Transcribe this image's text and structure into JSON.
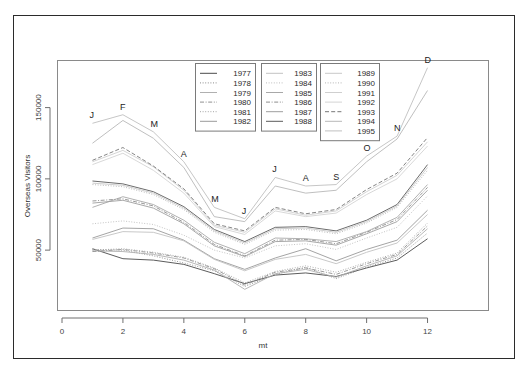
{
  "figure": {
    "frame_color": "#2b2b2b",
    "background": "#ffffff",
    "panel_border_color": "#8a8a8a"
  },
  "chart_data": {
    "type": "line",
    "title": "",
    "subtitle": "",
    "xlabel": "mt",
    "ylabel": "Overseas Visitors",
    "x": [
      1,
      2,
      3,
      4,
      5,
      6,
      7,
      8,
      9,
      10,
      11,
      12
    ],
    "xlim": [
      0,
      13
    ],
    "ylim": [
      8000,
      182000
    ],
    "xticks": [
      0,
      2,
      4,
      6,
      8,
      10,
      12
    ],
    "xticklabels": [
      "0",
      "2",
      "4",
      "6",
      "8",
      "10",
      "12"
    ],
    "yticks": [
      50000,
      100000,
      150000
    ],
    "yticklabels": [
      "50000",
      "100000",
      "150000"
    ],
    "grid": false,
    "legend_position": "top-center",
    "point_labels": [
      {
        "label": "J",
        "x": 1,
        "y": 139000
      },
      {
        "label": "F",
        "x": 2,
        "y": 145000
      },
      {
        "label": "M",
        "x": 3,
        "y": 133000
      },
      {
        "label": "A",
        "x": 4,
        "y": 112000
      },
      {
        "label": "M",
        "x": 5,
        "y": 80000
      },
      {
        "label": "J",
        "x": 6,
        "y": 72000
      },
      {
        "label": "J",
        "x": 7,
        "y": 101000
      },
      {
        "label": "A",
        "x": 8,
        "y": 95000
      },
      {
        "label": "S",
        "x": 9,
        "y": 96000
      },
      {
        "label": "O",
        "x": 10,
        "y": 116000
      },
      {
        "label": "N",
        "x": 11,
        "y": 130000
      },
      {
        "label": "D",
        "x": 12,
        "y": 178000
      }
    ],
    "series": [
      {
        "name": "1977",
        "dash": "solid",
        "color": "#4a4a4a",
        "values": [
          51000,
          44000,
          43000,
          40000,
          33500,
          26500,
          32500,
          34000,
          31500,
          37500,
          43000,
          58000
        ]
      },
      {
        "name": "1978",
        "dash": "dotted",
        "color": "#8c8c8c",
        "values": [
          50500,
          50000,
          46000,
          41000,
          35500,
          24500,
          33000,
          38000,
          30000,
          38000,
          44500,
          62000
        ]
      },
      {
        "name": "1979",
        "dash": "solid",
        "color": "#b0b0b0",
        "values": [
          49500,
          49000,
          47000,
          43000,
          36000,
          22500,
          33500,
          36500,
          31000,
          39000,
          46000,
          65000
        ]
      },
      {
        "name": "1980",
        "dash": "dashdot",
        "color": "#909090",
        "values": [
          49000,
          50500,
          48000,
          44500,
          37000,
          25500,
          34500,
          37500,
          33000,
          40500,
          47000,
          67000
        ]
      },
      {
        "name": "1981",
        "dash": "dotted",
        "color": "#a5a5a5",
        "values": [
          50000,
          51000,
          48500,
          45000,
          37500,
          27000,
          35000,
          39000,
          34500,
          41500,
          48000,
          69000
        ]
      },
      {
        "name": "1982",
        "dash": "solid",
        "color": "#9a9a9a",
        "values": [
          58500,
          65500,
          65000,
          57000,
          44000,
          36500,
          44500,
          51000,
          42500,
          50500,
          57000,
          78000
        ]
      },
      {
        "name": "1983",
        "dash": "solid",
        "color": "#c2c2c2",
        "values": [
          57500,
          63000,
          62500,
          56500,
          43500,
          35500,
          43500,
          47000,
          40500,
          48500,
          55000,
          75000
        ]
      },
      {
        "name": "1984",
        "dash": "dotted",
        "color": "#bdbdbd",
        "values": [
          68500,
          70500,
          68000,
          60500,
          50000,
          44500,
          53000,
          54500,
          50500,
          58500,
          66000,
          88000
        ]
      },
      {
        "name": "1985",
        "dash": "solid",
        "color": "#a8a8a8",
        "values": [
          80000,
          87500,
          82000,
          71000,
          55500,
          47500,
          58500,
          58000,
          56000,
          63000,
          73000,
          96000
        ]
      },
      {
        "name": "1986",
        "dash": "dashdot",
        "color": "#8d8d8d",
        "values": [
          84500,
          86000,
          81000,
          69500,
          54000,
          46000,
          57000,
          57500,
          54500,
          62500,
          71500,
          94000
        ]
      },
      {
        "name": "1987",
        "dash": "solid",
        "color": "#9e9e9e",
        "values": [
          83000,
          85000,
          79500,
          68500,
          53000,
          45500,
          56000,
          56500,
          53500,
          61500,
          70000,
          92000
        ]
      },
      {
        "name": "1988",
        "dash": "solid",
        "color": "#5a5a5a",
        "values": [
          98500,
          96500,
          91000,
          80500,
          64500,
          56000,
          66000,
          66500,
          63500,
          71000,
          82000,
          110000
        ]
      },
      {
        "name": "1989",
        "dash": "solid",
        "color": "#c8c8c8",
        "values": [
          97000,
          95500,
          90000,
          79500,
          63500,
          55000,
          65000,
          65500,
          62500,
          70000,
          81000,
          108000
        ]
      },
      {
        "name": "1990",
        "dash": "dotted",
        "color": "#b5b5b5",
        "values": [
          96000,
          94500,
          89000,
          78500,
          62500,
          54000,
          64000,
          64500,
          61500,
          69000,
          80000,
          106000
        ]
      },
      {
        "name": "1991",
        "dash": "solid",
        "color": "#cfcfcf",
        "values": [
          112000,
          120000,
          108500,
          92000,
          67500,
          62500,
          79000,
          74500,
          77500,
          91000,
          102500,
          126000
        ]
      },
      {
        "name": "1992",
        "dash": "solid",
        "color": "#d4d4d4",
        "values": [
          110000,
          118000,
          106000,
          90000,
          66500,
          61000,
          77500,
          73500,
          76000,
          89000,
          100000,
          123000
        ]
      },
      {
        "name": "1993",
        "dash": "dashed",
        "color": "#777777",
        "values": [
          113000,
          122000,
          109000,
          93000,
          68500,
          63500,
          80000,
          75500,
          78500,
          92500,
          104000,
          129000
        ]
      },
      {
        "name": "1994",
        "dash": "solid",
        "color": "#b8b8b8",
        "values": [
          125000,
          141000,
          128500,
          108000,
          73500,
          70000,
          95000,
          90000,
          92000,
          112000,
          128000,
          162000
        ]
      },
      {
        "name": "1995",
        "dash": "solid",
        "color": "#c0c0c0",
        "values": [
          139000,
          145000,
          133000,
          112000,
          80000,
          72000,
          101000,
          95000,
          96000,
          116000,
          130000,
          178000
        ]
      }
    ]
  },
  "legend": {
    "columns": [
      {
        "box_name": "legend-box-1",
        "entries": [
          {
            "label": "1977",
            "dash": "solid",
            "color": "#4a4a4a"
          },
          {
            "label": "1978",
            "dash": "dotted",
            "color": "#8c8c8c"
          },
          {
            "label": "1979",
            "dash": "solid",
            "color": "#b0b0b0"
          },
          {
            "label": "1980",
            "dash": "dashdot",
            "color": "#909090"
          },
          {
            "label": "1981",
            "dash": "dotted",
            "color": "#a5a5a5"
          },
          {
            "label": "1982",
            "dash": "solid",
            "color": "#9a9a9a"
          }
        ]
      },
      {
        "box_name": "legend-box-2",
        "entries": [
          {
            "label": "1983",
            "dash": "solid",
            "color": "#c2c2c2"
          },
          {
            "label": "1984",
            "dash": "dotted",
            "color": "#bdbdbd"
          },
          {
            "label": "1985",
            "dash": "solid",
            "color": "#a8a8a8"
          },
          {
            "label": "1986",
            "dash": "dashdot",
            "color": "#8d8d8d"
          },
          {
            "label": "1987",
            "dash": "solid",
            "color": "#9e9e9e"
          },
          {
            "label": "1988",
            "dash": "solid",
            "color": "#5a5a5a"
          }
        ]
      },
      {
        "box_name": "legend-box-3",
        "entries": [
          {
            "label": "1989",
            "dash": "solid",
            "color": "#c8c8c8"
          },
          {
            "label": "1990",
            "dash": "dotted",
            "color": "#b5b5b5"
          },
          {
            "label": "1991",
            "dash": "solid",
            "color": "#cfcfcf"
          },
          {
            "label": "1992",
            "dash": "solid",
            "color": "#d4d4d4"
          },
          {
            "label": "1993",
            "dash": "dashed",
            "color": "#777777"
          },
          {
            "label": "1994",
            "dash": "solid",
            "color": "#b8b8b8"
          },
          {
            "label": "1995",
            "dash": "solid",
            "color": "#c0c0c0"
          }
        ]
      }
    ]
  }
}
